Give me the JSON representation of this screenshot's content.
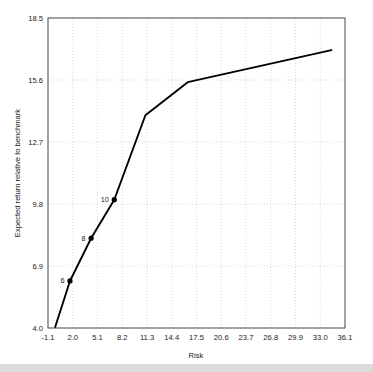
{
  "chart_data": {
    "type": "line",
    "title": "",
    "xlabel": "Risk",
    "ylabel": "Expected return relative to benchmark",
    "xlim": [
      -1.1,
      36.1
    ],
    "ylim": [
      4.0,
      18.5
    ],
    "xticks": [
      "-1.1",
      "2.0",
      "5.1",
      "8.2",
      "11.3",
      "14.4",
      "17.5",
      "20.6",
      "23.7",
      "26.8",
      "29.9",
      "33.0",
      "36.1"
    ],
    "xtick_values": [
      -1.1,
      2.0,
      5.1,
      8.2,
      11.3,
      14.4,
      17.5,
      20.6,
      23.7,
      26.8,
      29.9,
      33.0,
      36.1
    ],
    "yticks": [
      "18.5",
      "15.6",
      "12.7",
      "9.8",
      "6.9",
      "4.0"
    ],
    "ytick_values": [
      18.5,
      15.6,
      12.7,
      9.8,
      6.9,
      4.0
    ],
    "grid": true,
    "grid_style": "dotted",
    "grid_color": "#c8c8c8",
    "legend": "none",
    "line_color": "#000000",
    "marker_color": "#000000",
    "series": [
      {
        "name": "efficient frontier",
        "x": [
          -0.2,
          1.65,
          4.3,
          7.2,
          11.1,
          16.4,
          34.4
        ],
        "y": [
          4.05,
          6.2,
          8.2,
          10.0,
          13.95,
          15.5,
          17.0
        ]
      }
    ],
    "markers": [
      {
        "label": "6",
        "x": 1.65,
        "y": 6.2
      },
      {
        "label": "8",
        "x": 4.3,
        "y": 8.2
      },
      {
        "label": "10",
        "x": 7.2,
        "y": 10.0
      }
    ]
  }
}
